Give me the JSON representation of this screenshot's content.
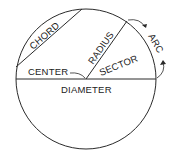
{
  "diagram": {
    "labels": {
      "chord": "CHORD",
      "radius": "RADIUS",
      "sector": "SECTOR",
      "arc": "ARC",
      "center": "CENTER",
      "diameter": "DIAMETER"
    },
    "colors": {
      "stroke": "#2a2a2a",
      "background": "#ffffff"
    }
  }
}
